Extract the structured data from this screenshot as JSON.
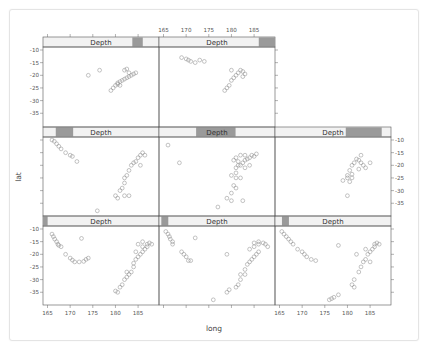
{
  "chart_data": {
    "type": "scatter",
    "title": "",
    "xlabel": "long",
    "ylabel": "lat",
    "conditioning_variable": "Depth",
    "layout": {
      "columns": 3,
      "rows": 3,
      "panel_count": 8,
      "order": "bottom-left to top, left to right"
    },
    "xlim": [
      164,
      189
    ],
    "ylim": [
      -39.5,
      -8
    ],
    "x_ticks": [
      165,
      170,
      175,
      180,
      185
    ],
    "y_ticks": [
      -10,
      -15,
      -20,
      -25,
      -30,
      -35
    ],
    "grid": false,
    "marker": "open circle",
    "panels": [
      {
        "strip": "Depth",
        "shingle_range": [
          0.0,
          0.04
        ],
        "row": 3,
        "col": 1,
        "points": [
          [
            166,
            -12
          ],
          [
            166.3,
            -13
          ],
          [
            166.6,
            -14
          ],
          [
            167,
            -15
          ],
          [
            167.3,
            -16
          ],
          [
            167.5,
            -16.5
          ],
          [
            168,
            -17
          ],
          [
            169,
            -20
          ],
          [
            170,
            -21.5
          ],
          [
            170.5,
            -22.3
          ],
          [
            171,
            -23
          ],
          [
            172,
            -23
          ],
          [
            172.5,
            -13.7
          ],
          [
            173,
            -22.8
          ],
          [
            173.5,
            -22
          ],
          [
            174,
            -21.5
          ],
          [
            180,
            -34.5
          ],
          [
            180.5,
            -35
          ],
          [
            181,
            -33
          ],
          [
            181.5,
            -32
          ],
          [
            182,
            -30
          ],
          [
            182.5,
            -29
          ],
          [
            182.5,
            -27
          ],
          [
            183,
            -28
          ],
          [
            183.5,
            -27
          ],
          [
            184,
            -25
          ],
          [
            184,
            -23.5
          ],
          [
            184.5,
            -22
          ],
          [
            184.5,
            -19
          ],
          [
            185,
            -21
          ],
          [
            185.5,
            -20
          ],
          [
            186,
            -19
          ],
          [
            186.5,
            -18
          ],
          [
            186,
            -17
          ],
          [
            186,
            -15
          ],
          [
            187,
            -16
          ],
          [
            187.5,
            -15.5
          ],
          [
            188,
            -16
          ],
          [
            187,
            -17
          ],
          [
            185,
            -16
          ]
        ]
      },
      {
        "strip": "Depth",
        "shingle_range": [
          0.02,
          0.08
        ],
        "row": 3,
        "col": 2,
        "points": [
          [
            165.5,
            -11
          ],
          [
            166,
            -12
          ],
          [
            166.3,
            -13
          ],
          [
            166.5,
            -14
          ],
          [
            167,
            -15
          ],
          [
            167,
            -16
          ],
          [
            169,
            -19
          ],
          [
            169.5,
            -20
          ],
          [
            170,
            -21
          ],
          [
            170.5,
            -22.5
          ],
          [
            171,
            -22.5
          ],
          [
            172,
            -13.5
          ],
          [
            176,
            -38
          ],
          [
            179,
            -35
          ],
          [
            179.5,
            -34
          ],
          [
            179,
            -20
          ],
          [
            181,
            -33
          ],
          [
            181.5,
            -32
          ],
          [
            182,
            -30
          ],
          [
            182,
            -28
          ],
          [
            183,
            -28
          ],
          [
            183,
            -26
          ],
          [
            183.5,
            -24
          ],
          [
            184,
            -23
          ],
          [
            184.5,
            -22
          ],
          [
            185,
            -21
          ],
          [
            185.5,
            -20
          ],
          [
            186,
            -19
          ],
          [
            184,
            -18
          ],
          [
            185,
            -17
          ],
          [
            186,
            -16
          ],
          [
            187,
            -15.5
          ],
          [
            187.5,
            -16
          ],
          [
            188,
            -17
          ],
          [
            186,
            -15
          ],
          [
            185,
            -15.5
          ]
        ]
      },
      {
        "strip": "Depth",
        "shingle_range": [
          0.06,
          0.12
        ],
        "row": 3,
        "col": 3,
        "points": [
          [
            165.5,
            -11
          ],
          [
            166,
            -12
          ],
          [
            166.5,
            -13
          ],
          [
            167,
            -14
          ],
          [
            167.5,
            -15
          ],
          [
            168,
            -16
          ],
          [
            169,
            -18
          ],
          [
            170,
            -19
          ],
          [
            170.5,
            -20
          ],
          [
            171,
            -21
          ],
          [
            172,
            -22
          ],
          [
            173,
            -22.5
          ],
          [
            176,
            -38
          ],
          [
            176.5,
            -37.5
          ],
          [
            177,
            -37
          ],
          [
            178,
            -36
          ],
          [
            178,
            -16.5
          ],
          [
            181,
            -32
          ],
          [
            181.5,
            -33
          ],
          [
            181.5,
            -30
          ],
          [
            182,
            -20
          ],
          [
            182.5,
            -27
          ],
          [
            183,
            -25
          ],
          [
            183.5,
            -23
          ],
          [
            184,
            -22
          ],
          [
            184.5,
            -20
          ],
          [
            185,
            -19
          ],
          [
            185.5,
            -18
          ],
          [
            186,
            -17
          ],
          [
            186,
            -16
          ],
          [
            186.5,
            -15.5
          ],
          [
            187,
            -16
          ],
          [
            185,
            -23
          ],
          [
            184,
            -18
          ]
        ]
      },
      {
        "strip": "Depth",
        "shingle_range": [
          0.11,
          0.26
        ],
        "row": 2,
        "col": 1,
        "points": [
          [
            166,
            -10
          ],
          [
            166.5,
            -10.5
          ],
          [
            167,
            -11.5
          ],
          [
            167.5,
            -12.5
          ],
          [
            168,
            -13.5
          ],
          [
            169,
            -15
          ],
          [
            170,
            -16
          ],
          [
            170.5,
            -16.5
          ],
          [
            171.5,
            -18.5
          ],
          [
            176,
            -38
          ],
          [
            180,
            -32
          ],
          [
            180.5,
            -33
          ],
          [
            181,
            -30
          ],
          [
            181.5,
            -29
          ],
          [
            182,
            -27
          ],
          [
            182,
            -25
          ],
          [
            182.5,
            -24
          ],
          [
            183,
            -22
          ],
          [
            183.5,
            -20
          ],
          [
            184,
            -19
          ],
          [
            184.5,
            -18.5
          ],
          [
            185,
            -17
          ],
          [
            185.5,
            -16
          ],
          [
            186,
            -15
          ],
          [
            186.5,
            -16
          ],
          [
            185.5,
            -20
          ],
          [
            182,
            -32
          ],
          [
            183,
            -32
          ]
        ]
      },
      {
        "strip": "Depth",
        "shingle_range": [
          0.32,
          0.66
        ],
        "row": 2,
        "col": 2,
        "points": [
          [
            166,
            -12
          ],
          [
            168.5,
            -19
          ],
          [
            177,
            -36.5
          ],
          [
            179,
            -33
          ],
          [
            180,
            -31
          ],
          [
            181,
            -29
          ],
          [
            180.5,
            -28
          ],
          [
            180,
            -24
          ],
          [
            181,
            -23
          ],
          [
            181,
            -21
          ],
          [
            181.5,
            -20
          ],
          [
            180.5,
            -18
          ],
          [
            182,
            -20
          ],
          [
            182.5,
            -19
          ],
          [
            183,
            -18
          ],
          [
            183.5,
            -17.5
          ],
          [
            184,
            -17
          ],
          [
            184.5,
            -16
          ],
          [
            185,
            -16.5
          ],
          [
            185.5,
            -15.5
          ],
          [
            183,
            -16
          ],
          [
            182,
            -16
          ],
          [
            181,
            -17
          ],
          [
            181.5,
            -18.5
          ],
          [
            184,
            -20
          ],
          [
            183,
            -21
          ],
          [
            181,
            -25
          ],
          [
            182,
            -25
          ],
          [
            180,
            -34
          ],
          [
            182.5,
            -34
          ]
        ]
      },
      {
        "strip": "Depth",
        "shingle_range": [
          0.61,
          0.92
        ],
        "row": 2,
        "col": 3,
        "points": [
          [
            179,
            -26
          ],
          [
            180,
            -25
          ],
          [
            180,
            -24
          ],
          [
            180.5,
            -26.5
          ],
          [
            181,
            -25
          ],
          [
            181,
            -23.5
          ],
          [
            180.5,
            -22
          ],
          [
            181,
            -20
          ],
          [
            182,
            -17.5
          ],
          [
            182.5,
            -18
          ],
          [
            183,
            -19
          ],
          [
            183.5,
            -20
          ],
          [
            184,
            -21
          ],
          [
            182.5,
            -21.5
          ],
          [
            183,
            -16
          ],
          [
            185,
            -19
          ],
          [
            180,
            -32
          ],
          [
            181.5,
            -19
          ]
        ]
      },
      {
        "strip": "Depth",
        "shingle_range": [
          0.77,
          0.86
        ],
        "row": 1,
        "col": 1,
        "points": [
          [
            174,
            -20
          ],
          [
            176.5,
            -18
          ],
          [
            179,
            -26
          ],
          [
            179.5,
            -25
          ],
          [
            180,
            -24
          ],
          [
            180.5,
            -23
          ],
          [
            181,
            -22.5
          ],
          [
            181.5,
            -22
          ],
          [
            182,
            -21.5
          ],
          [
            182.5,
            -21
          ],
          [
            183,
            -20.5
          ],
          [
            183.5,
            -20
          ],
          [
            184,
            -19.5
          ],
          [
            184.5,
            -19
          ],
          [
            183,
            -19
          ],
          [
            182,
            -18
          ],
          [
            182.5,
            -17.5
          ],
          [
            180.5,
            -23.5
          ],
          [
            181,
            -24
          ]
        ]
      },
      {
        "strip": "Depth",
        "shingle_range": [
          0.86,
          1.0
        ],
        "row": 1,
        "col": 2,
        "points": [
          [
            169,
            -13
          ],
          [
            170,
            -13.5
          ],
          [
            170.5,
            -14
          ],
          [
            171,
            -14.5
          ],
          [
            172,
            -15
          ],
          [
            173,
            -14
          ],
          [
            174,
            -14.5
          ],
          [
            178.5,
            -26
          ],
          [
            179,
            -25
          ],
          [
            179.5,
            -24
          ],
          [
            180,
            -22
          ],
          [
            180.5,
            -21
          ],
          [
            181,
            -20
          ],
          [
            181.5,
            -19
          ],
          [
            182,
            -18
          ],
          [
            182.5,
            -18.5
          ],
          [
            183,
            -19.5
          ],
          [
            182.5,
            -20.5
          ],
          [
            180,
            -18
          ]
        ]
      }
    ]
  },
  "labels": {
    "strip": "Depth",
    "xlabel": "long",
    "ylabel": "lat",
    "x_ticks": [
      "165",
      "170",
      "175",
      "180",
      "185"
    ],
    "y_ticks": [
      "-10",
      "-15",
      "-20",
      "-25",
      "-30",
      "-35"
    ]
  },
  "colors": {
    "strip_bg": "#f2f2f2",
    "shingle": "#9a9a9a",
    "panel_border": "#555555",
    "point": "#8a8a8a",
    "axis": "#666666"
  }
}
